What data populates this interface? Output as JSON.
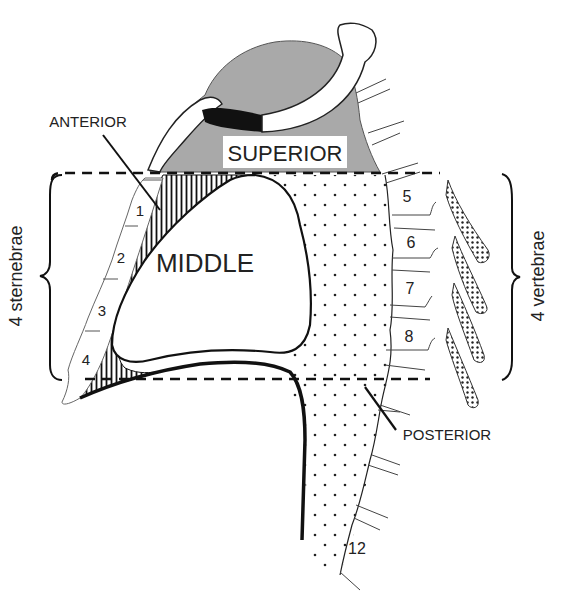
{
  "diagram": {
    "regions": {
      "superior": {
        "label": "SUPERIOR",
        "fill": "#a9a9a9"
      },
      "anterior": {
        "label": "ANTERIOR",
        "fill": "hatched"
      },
      "middle": {
        "label": "MIDDLE",
        "fill": "#ffffff"
      },
      "posterior": {
        "label": "POSTERIOR",
        "fill": "dotted"
      }
    },
    "sternum": {
      "brace_label": "4 sternebrae",
      "sternebrae": [
        "1",
        "2",
        "3",
        "4"
      ]
    },
    "spine": {
      "brace_label": "4 vertebrae",
      "vertebrae": [
        "5",
        "6",
        "7",
        "8"
      ],
      "last_vertebra": "12"
    },
    "colors": {
      "line": "#111111",
      "superior_gray": "#a9a9a9",
      "background": "#ffffff"
    }
  }
}
